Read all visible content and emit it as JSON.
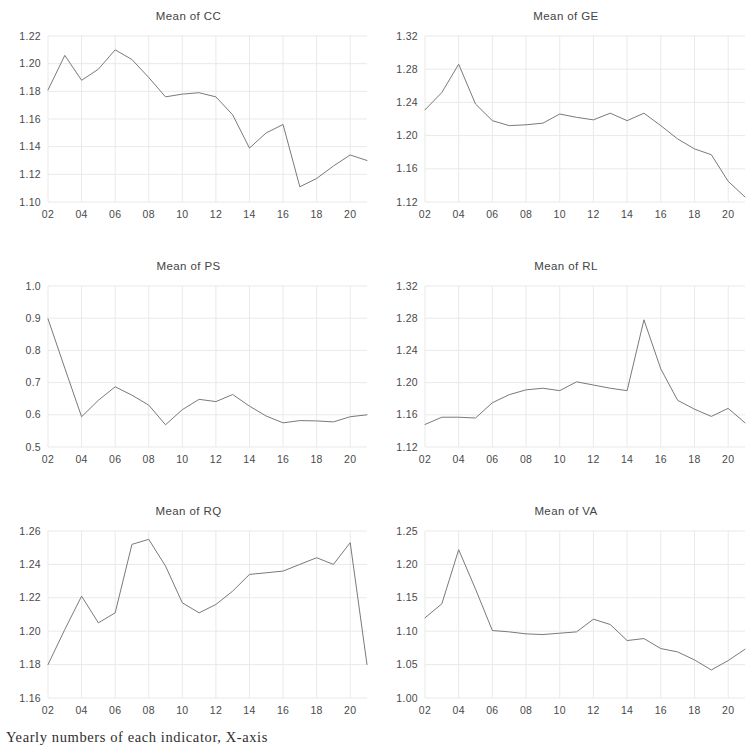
{
  "figure": {
    "caption": "Yearly numbers of each indicator, X-axis",
    "x_tick_labels": [
      "02",
      "04",
      "06",
      "08",
      "10",
      "12",
      "14",
      "16",
      "18",
      "20"
    ],
    "x_years": [
      "02",
      "03",
      "04",
      "05",
      "06",
      "07",
      "08",
      "09",
      "10",
      "11",
      "12",
      "13",
      "14",
      "15",
      "16",
      "17",
      "18",
      "19",
      "20",
      "21"
    ],
    "line_color": "#7a7a7a",
    "grid_color": "#e9e9e9",
    "text_color": "#4a4a4a"
  },
  "chart_data": [
    {
      "type": "line",
      "title": "Mean of CC",
      "xlabel": "",
      "ylabel": "",
      "grid": true,
      "legend": "none",
      "x": [
        "02",
        "03",
        "04",
        "05",
        "06",
        "07",
        "08",
        "09",
        "10",
        "11",
        "12",
        "13",
        "14",
        "15",
        "16",
        "17",
        "18",
        "19",
        "20",
        "21"
      ],
      "ylim": [
        1.1,
        1.22
      ],
      "yticks": [
        1.1,
        1.12,
        1.14,
        1.16,
        1.18,
        1.2,
        1.22
      ],
      "ytick_labels": [
        "1.10",
        "1.12",
        "1.14",
        "1.16",
        "1.18",
        "1.20",
        "1.22"
      ],
      "values": [
        1.181,
        1.206,
        1.188,
        1.196,
        1.21,
        1.203,
        1.19,
        1.176,
        1.178,
        1.179,
        1.176,
        1.163,
        1.139,
        1.15,
        1.156,
        1.111,
        1.117,
        1.126,
        1.134,
        1.13
      ]
    },
    {
      "type": "line",
      "title": "Mean of GE",
      "xlabel": "",
      "ylabel": "",
      "grid": true,
      "legend": "none",
      "x": [
        "02",
        "03",
        "04",
        "05",
        "06",
        "07",
        "08",
        "09",
        "10",
        "11",
        "12",
        "13",
        "14",
        "15",
        "16",
        "17",
        "18",
        "19",
        "20",
        "21"
      ],
      "ylim": [
        1.12,
        1.32
      ],
      "yticks": [
        1.12,
        1.16,
        1.2,
        1.24,
        1.28,
        1.32
      ],
      "ytick_labels": [
        "1.12",
        "1.16",
        "1.20",
        "1.24",
        "1.28",
        "1.32"
      ],
      "values": [
        1.231,
        1.252,
        1.286,
        1.238,
        1.218,
        1.212,
        1.213,
        1.215,
        1.226,
        1.222,
        1.219,
        1.227,
        1.218,
        1.227,
        1.212,
        1.196,
        1.184,
        1.177,
        1.145,
        1.126
      ]
    },
    {
      "type": "line",
      "title": "Mean of PS",
      "xlabel": "",
      "ylabel": "",
      "grid": true,
      "legend": "none",
      "x": [
        "02",
        "03",
        "04",
        "05",
        "06",
        "07",
        "08",
        "09",
        "10",
        "11",
        "12",
        "13",
        "14",
        "15",
        "16",
        "17",
        "18",
        "19",
        "20",
        "21"
      ],
      "ylim": [
        0.5,
        1.0
      ],
      "yticks": [
        0.5,
        0.6,
        0.7,
        0.8,
        0.9,
        1.0
      ],
      "ytick_labels": [
        "0.5",
        "0.6",
        "0.7",
        "0.8",
        "0.9",
        "1.0"
      ],
      "values": [
        0.898,
        0.745,
        0.594,
        0.645,
        0.687,
        0.661,
        0.63,
        0.569,
        0.616,
        0.648,
        0.641,
        0.663,
        0.627,
        0.596,
        0.575,
        0.582,
        0.581,
        0.578,
        0.594,
        0.6
      ]
    },
    {
      "type": "line",
      "title": "Mean of RL",
      "xlabel": "",
      "ylabel": "",
      "grid": true,
      "legend": "none",
      "x": [
        "02",
        "03",
        "04",
        "05",
        "06",
        "07",
        "08",
        "09",
        "10",
        "11",
        "12",
        "13",
        "14",
        "15",
        "16",
        "17",
        "18",
        "19",
        "20",
        "21"
      ],
      "ylim": [
        1.12,
        1.32
      ],
      "yticks": [
        1.12,
        1.16,
        1.2,
        1.24,
        1.28,
        1.32
      ],
      "ytick_labels": [
        "1.12",
        "1.16",
        "1.20",
        "1.24",
        "1.28",
        "1.32"
      ],
      "values": [
        1.148,
        1.157,
        1.157,
        1.156,
        1.175,
        1.185,
        1.191,
        1.193,
        1.19,
        1.201,
        1.197,
        1.193,
        1.19,
        1.278,
        1.217,
        1.178,
        1.167,
        1.158,
        1.168,
        1.15
      ]
    },
    {
      "type": "line",
      "title": "Mean of RQ",
      "xlabel": "",
      "ylabel": "",
      "grid": true,
      "legend": "none",
      "x": [
        "02",
        "03",
        "04",
        "05",
        "06",
        "07",
        "08",
        "09",
        "10",
        "11",
        "12",
        "13",
        "14",
        "15",
        "16",
        "17",
        "18",
        "19",
        "20",
        "21"
      ],
      "ylim": [
        1.16,
        1.26
      ],
      "yticks": [
        1.16,
        1.18,
        1.2,
        1.22,
        1.24,
        1.26
      ],
      "ytick_labels": [
        "1.16",
        "1.18",
        "1.20",
        "1.22",
        "1.24",
        "1.26"
      ],
      "values": [
        1.18,
        1.201,
        1.221,
        1.205,
        1.211,
        1.252,
        1.255,
        1.239,
        1.217,
        1.211,
        1.216,
        1.224,
        1.234,
        1.235,
        1.236,
        1.24,
        1.244,
        1.24,
        1.253,
        1.18
      ]
    },
    {
      "type": "line",
      "title": "Mean of VA",
      "xlabel": "",
      "ylabel": "",
      "grid": true,
      "legend": "none",
      "x": [
        "02",
        "03",
        "04",
        "05",
        "06",
        "07",
        "08",
        "09",
        "10",
        "11",
        "12",
        "13",
        "14",
        "15",
        "16",
        "17",
        "18",
        "19",
        "20",
        "21"
      ],
      "ylim": [
        1.0,
        1.25
      ],
      "yticks": [
        1.0,
        1.05,
        1.1,
        1.15,
        1.2,
        1.25
      ],
      "ytick_labels": [
        "1.00",
        "1.05",
        "1.10",
        "1.15",
        "1.20",
        "1.25"
      ],
      "values": [
        1.12,
        1.141,
        1.222,
        1.163,
        1.101,
        1.099,
        1.096,
        1.095,
        1.097,
        1.099,
        1.118,
        1.11,
        1.086,
        1.089,
        1.074,
        1.069,
        1.057,
        1.042,
        1.056,
        1.073
      ]
    }
  ]
}
